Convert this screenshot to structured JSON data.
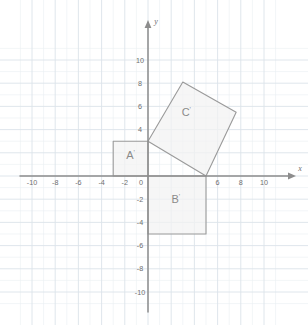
{
  "chart_data": {
    "type": "scatter",
    "title": "",
    "xlabel": "x",
    "ylabel": "y",
    "xlim": [
      -11.5,
      11.5
    ],
    "ylim": [
      -11.5,
      11.5
    ],
    "grid": true,
    "grid_minor_step": 1,
    "grid_major_step": 2,
    "x_ticks": [
      -10,
      -8,
      -6,
      -4,
      -2,
      0,
      2,
      4,
      6,
      8,
      10
    ],
    "x_tick_labels": [
      "-10",
      "-8",
      "-6",
      "-4",
      "-2",
      "0",
      "",
      "",
      "6",
      "8",
      "10"
    ],
    "y_ticks": [
      -10,
      -8,
      -6,
      -4,
      -2,
      0,
      2,
      4,
      6,
      8,
      10
    ],
    "y_tick_labels": [
      "-10",
      "-8",
      "-6",
      "-4",
      "-2",
      "0",
      "",
      "4",
      "6",
      "8",
      "10"
    ],
    "legend": "none",
    "shapes": [
      {
        "name": "A'",
        "label": "A",
        "prime": "'",
        "kind": "square",
        "vertices": [
          [
            -3,
            0
          ],
          [
            0,
            0
          ],
          [
            0,
            3
          ],
          [
            -3,
            3
          ]
        ],
        "label_point": [
          -1.5,
          1.5
        ],
        "fill": "#f2f2f2",
        "stroke": "#9a9a9a"
      },
      {
        "name": "B'",
        "label": "B",
        "prime": "'",
        "kind": "square",
        "vertices": [
          [
            0,
            0
          ],
          [
            5,
            0
          ],
          [
            5,
            -5
          ],
          [
            0,
            -5
          ]
        ],
        "label_point": [
          2.4,
          -2.3
        ],
        "fill": "#f2f2f2",
        "stroke": "#9a9a9a"
      },
      {
        "name": "C'",
        "label": "C",
        "prime": "'",
        "kind": "square-rotated",
        "vertices": [
          [
            0,
            3
          ],
          [
            5,
            0
          ],
          [
            7.6,
            5.5
          ],
          [
            3,
            8.1
          ]
        ],
        "label_point": [
          3.3,
          5.2
        ],
        "fill": "#f2f2f2",
        "stroke": "#9a9a9a"
      }
    ],
    "axis_labels": {
      "x": "x",
      "y": "y"
    },
    "origin_label": "0"
  },
  "colors": {
    "background": "#ffffff",
    "grid_minor": "#e9eef2",
    "grid_major": "#dbe3ea",
    "axis": "#8d8d8d",
    "shape_fill": "#f2f2f2",
    "shape_stroke": "#9a9a9a",
    "tick_text": "#6f6f6f",
    "shape_label_text": "#8a8a8a"
  }
}
